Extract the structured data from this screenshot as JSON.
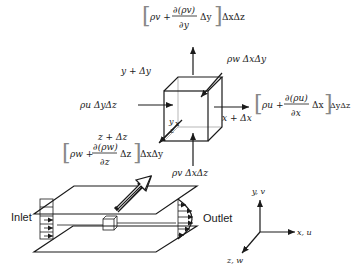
{
  "diagram": {
    "flux_top": {
      "bracket_open": "[",
      "lead": "ρv +",
      "numerator": "∂(ρv)",
      "denominator": "∂y",
      "delta": "Δy",
      "bracket_close": "]",
      "tail": "ΔxΔz"
    },
    "flux_right": {
      "bracket_open": "[",
      "lead": "ρu +",
      "numerator": "∂(ρu)",
      "denominator": "∂x",
      "delta": "Δx",
      "bracket_close": "]",
      "tail": "ΔyΔz"
    },
    "flux_front": {
      "bracket_open": "[",
      "lead": "ρw +",
      "numerator": "∂(ρw)",
      "denominator": "∂z",
      "delta": "Δz",
      "bracket_close": "]",
      "tail": "ΔxΔy"
    },
    "flux_left": "ρu ΔyΔz",
    "flux_bottom": "ρv ΔxΔz",
    "flux_back": "ρw ΔxΔy",
    "face_labels": {
      "y_plus": "y + Δy",
      "x_plus": "x + Δx",
      "z_plus": "z + Δz",
      "origin_x": "x",
      "origin_y": "y",
      "origin_z": "z"
    },
    "channel": {
      "inlet_label": "Inlet",
      "outlet_label": "Outlet"
    },
    "axes": {
      "x_label": "x, u",
      "y_label": "y, v",
      "z_label": "z, w"
    }
  }
}
